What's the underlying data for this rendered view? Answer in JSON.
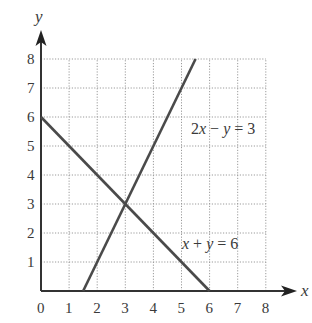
{
  "chart_data": {
    "type": "line",
    "title": "",
    "xlabel": "x",
    "ylabel": "y",
    "xlim": [
      0,
      8
    ],
    "ylim": [
      0,
      8
    ],
    "grid": true,
    "grid_style": "dotted",
    "x_ticks": [
      "0",
      "1",
      "2",
      "3",
      "4",
      "5",
      "6",
      "7",
      "8"
    ],
    "y_ticks": [
      "1",
      "2",
      "3",
      "4",
      "5",
      "6",
      "7",
      "8"
    ],
    "series": [
      {
        "name": "x + y = 6",
        "label_parts": [
          "x",
          " + ",
          "y",
          " = 6"
        ],
        "points": [
          [
            0,
            6
          ],
          [
            6,
            0
          ]
        ],
        "color": "#4a4a4a"
      },
      {
        "name": "2x − y = 3",
        "label_parts": [
          "2",
          "x",
          " − ",
          "y",
          " = 3"
        ],
        "points": [
          [
            1.5,
            0
          ],
          [
            5.5,
            8
          ]
        ],
        "color": "#4a4a4a"
      }
    ],
    "annotations": [
      {
        "text": "2x − y = 3",
        "x": 5.3,
        "y": 5.0
      },
      {
        "text": "x + y = 6",
        "x": 5.3,
        "y": 1.8
      }
    ],
    "intersection": [
      3,
      3
    ],
    "legend": "none"
  },
  "axes": {
    "x_title": "x",
    "y_title": "y"
  },
  "labels": {
    "line1_a": "2",
    "line1_b": "x",
    "line1_c": " − ",
    "line1_d": "y",
    "line1_e": " = 3",
    "line2_a": "x",
    "line2_b": " + ",
    "line2_c": "y",
    "line2_d": " = 6"
  },
  "colors": {
    "axis": "#333333",
    "grid": "#9a9a9a",
    "line": "#4a4a4a",
    "text": "#3a3a3a"
  }
}
